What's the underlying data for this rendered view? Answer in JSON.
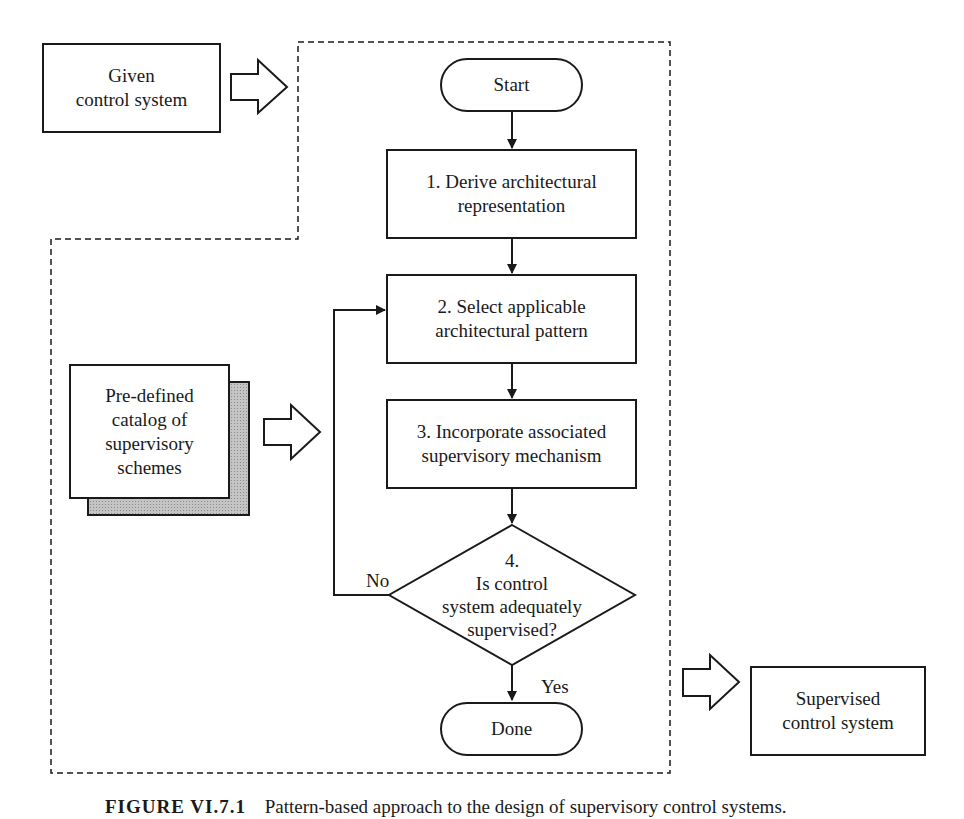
{
  "diagram": {
    "type": "flowchart",
    "inputs": {
      "given_system": {
        "line1": "Given",
        "line2": "control system"
      },
      "catalog": {
        "line1": "Pre-defined",
        "line2": "catalog of",
        "line3": "supervisory",
        "line4": "schemes"
      }
    },
    "output": {
      "line1": "Supervised",
      "line2": "control system"
    },
    "flow": {
      "start": "Start",
      "step1": {
        "line1": "1. Derive architectural",
        "line2": "representation"
      },
      "step2": {
        "line1": "2. Select applicable",
        "line2": "architectural pattern"
      },
      "step3": {
        "line1": "3. Incorporate associated",
        "line2": "supervisory mechanism"
      },
      "decision": {
        "line1": "4.",
        "line2": "Is control",
        "line3": "system adequately",
        "line4": "supervised?"
      },
      "no_label": "No",
      "yes_label": "Yes",
      "done": "Done"
    },
    "caption": {
      "figure": "FIGURE VI.7.1",
      "text": "Pattern-based approach to the design of supervisory control systems."
    },
    "colors": {
      "stroke": "#1a1a1a",
      "shadow_fill": "#b0b0b0",
      "background": "#ffffff"
    }
  }
}
